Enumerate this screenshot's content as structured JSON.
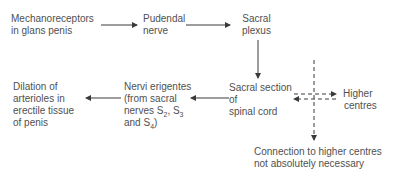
{
  "diagram": {
    "nodes": {
      "mechanoreceptors": {
        "line1": "Mechanoreceptors",
        "line2": "in glans penis"
      },
      "pudendal": {
        "line1": "Pudendal",
        "line2": "nerve"
      },
      "sacral_plexus": {
        "line1": "Sacral",
        "line2": "plexus"
      },
      "sacral_section": {
        "line1": "Sacral section",
        "line2": "of",
        "line3": "spinal cord"
      },
      "higher_centres": {
        "line1": "Higher",
        "line2": "centres"
      },
      "nervi_erigentes": {
        "line1": "Nervi erigentes",
        "line2": "(from sacral",
        "line3_prefix": "nerves S",
        "s2": "2",
        "s3_sep": ", S",
        "s3": "3",
        "line4_prefix": "and S",
        "s4": "4",
        "line4_suffix": ")"
      },
      "dilation": {
        "line1": "Dilation of",
        "line2": "arterioles in",
        "line3": "erectile tissue",
        "line4": "of penis"
      },
      "note": {
        "line1": "Connection to higher centres",
        "line2": "not absolutely necessary"
      }
    },
    "edges": [
      {
        "from": "mechanoreceptors",
        "to": "pudendal",
        "style": "solid"
      },
      {
        "from": "pudendal",
        "to": "sacral_plexus",
        "style": "solid"
      },
      {
        "from": "sacral_plexus",
        "to": "sacral_section",
        "style": "solid"
      },
      {
        "from": "sacral_section",
        "to": "nervi_erigentes",
        "style": "solid"
      },
      {
        "from": "nervi_erigentes",
        "to": "dilation",
        "style": "solid"
      },
      {
        "from": "sacral_section",
        "to": "higher_centres",
        "style": "dashed"
      },
      {
        "from": "higher_centres",
        "to": "sacral_section",
        "style": "dashed"
      },
      {
        "from": "vertical_dashed",
        "to": "note",
        "style": "dashed"
      }
    ],
    "line_color": "#3a3a3a"
  }
}
